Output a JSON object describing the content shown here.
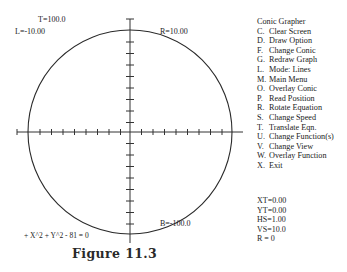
{
  "graph": {
    "top_label": "T=100.0",
    "left_label": "L=-10.00",
    "right_label": "R=10.00",
    "bottom_label": "B=-100.0",
    "equation": "+ X^2 + Y^2 - 81 = 0",
    "curve": "circle",
    "center": [
      0,
      0
    ],
    "radius_sq": 81
  },
  "menu": {
    "title": "Conic Grapher",
    "items": [
      {
        "key": "C.",
        "label": "Clear Screen"
      },
      {
        "key": "D.",
        "label": "Draw Option"
      },
      {
        "key": "F.",
        "label": "Change Conic"
      },
      {
        "key": "G.",
        "label": "Redraw Graph"
      },
      {
        "key": "L.",
        "label": "Mode: Lines"
      },
      {
        "key": "M.",
        "label": "Main Menu"
      },
      {
        "key": "O.",
        "label": "Overlay Conic"
      },
      {
        "key": "P.",
        "label": "Read Position"
      },
      {
        "key": "R.",
        "label": "Rotate Equation"
      },
      {
        "key": "S.",
        "label": "Change Speed"
      },
      {
        "key": "T.",
        "label": "Translate Eqn."
      },
      {
        "key": "U.",
        "label": "Change Function(s)"
      },
      {
        "key": "V.",
        "label": "Change View"
      },
      {
        "key": "W.",
        "label": "Overlay Function"
      },
      {
        "key": "X.",
        "label": "Exit"
      }
    ]
  },
  "status": {
    "xt": "XT=0.00",
    "yt": "YT=0.00",
    "hs": "HS=1.00",
    "vs": "VS=10.0",
    "r": "R = 0"
  },
  "caption": "Figure 11.3"
}
